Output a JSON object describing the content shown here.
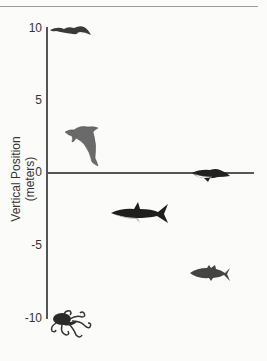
{
  "diagram": {
    "ylabel": "Vertical Position (meters)",
    "ticks": [
      {
        "label": "10",
        "value": 10
      },
      {
        "label": "5",
        "value": 5
      },
      {
        "label": "0",
        "value": 0
      },
      {
        "label": "-5",
        "value": -5
      },
      {
        "label": "-10",
        "value": -10
      }
    ],
    "ylim": [
      -10,
      10
    ],
    "animals": [
      {
        "name": "bird",
        "approx_position_m": 10
      },
      {
        "name": "dolphin",
        "approx_position_m": 3
      },
      {
        "name": "penguin",
        "approx_position_m": 0
      },
      {
        "name": "shark",
        "approx_position_m": -3
      },
      {
        "name": "tuna",
        "approx_position_m": -7
      },
      {
        "name": "octopus",
        "approx_position_m": -10
      }
    ],
    "colors": {
      "axis": "#555555",
      "animal_dark": "#2a2a2a",
      "dolphin": "#6a6a6a",
      "background": "#fbfbfa"
    }
  }
}
